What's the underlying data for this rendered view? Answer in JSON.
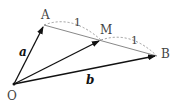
{
  "diagram": {
    "points": {
      "O": {
        "label": "O",
        "x": 14,
        "y": 84
      },
      "A": {
        "label": "A",
        "x": 44,
        "y": 25
      },
      "M": {
        "label": "M",
        "x": 101,
        "y": 41
      },
      "B": {
        "label": "B",
        "x": 157,
        "y": 56
      }
    },
    "vectors": {
      "a": {
        "label": "a",
        "from": "O",
        "to": "A"
      },
      "b": {
        "label": "b",
        "from": "O",
        "to": "B"
      },
      "m": {
        "label": "",
        "from": "O",
        "to": "M"
      }
    },
    "ratio_labels": {
      "AM": "1",
      "MB": "1"
    },
    "colors": {
      "vector": "#111111",
      "segment": "#888888",
      "dashed": "#999999",
      "text": "#444444"
    }
  }
}
